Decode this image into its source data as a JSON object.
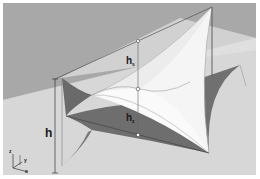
{
  "figure": {
    "labels": {
      "total_height": "h",
      "sag": "h",
      "sag_sub": "s",
      "rise": "h",
      "rise_sub": "z"
    },
    "axes": {
      "z": "z",
      "y": "y",
      "x": "x"
    },
    "colors": {
      "background_sky": "#a9a9a9",
      "ground": "#d6d6d6",
      "membrane": "#f4f4f4",
      "shadow": "#6e6e6e",
      "lines": "#555555"
    }
  }
}
